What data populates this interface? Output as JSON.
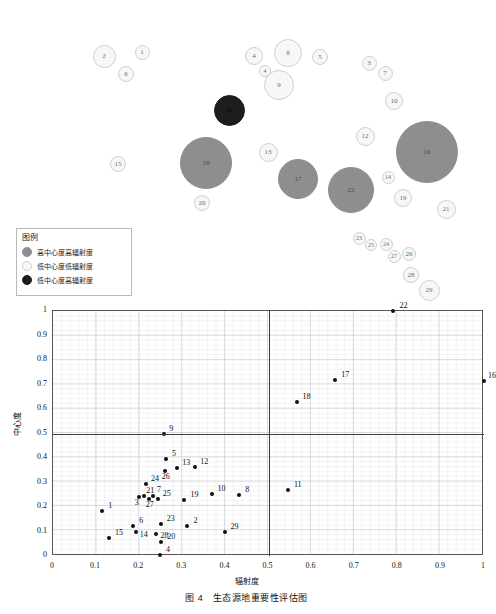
{
  "caption": "图 4　生态源地重要性评估图",
  "legend": {
    "title": "图例",
    "items": [
      {
        "label": "高中心度高辐射度",
        "swatch": "high",
        "color": "#8e8e8e"
      },
      {
        "label": "低中心度低辐射度",
        "swatch": "low",
        "color": "#f7f7f7"
      },
      {
        "label": "低中心度高辐射度",
        "swatch": "dark",
        "color": "#1d1d1d"
      }
    ]
  },
  "bubble_map": {
    "bubbles": [
      {
        "id": "2",
        "label": "2",
        "cx": 104,
        "cy": 56,
        "r": 11.5,
        "cls": "low"
      },
      {
        "id": "1",
        "label": "1",
        "cx": 142,
        "cy": 52,
        "r": 7.5,
        "cls": "low"
      },
      {
        "id": "6",
        "label": "6",
        "cx": 126,
        "cy": 74,
        "r": 8.0,
        "cls": "low"
      },
      {
        "id": "4a",
        "label": "4",
        "cx": 254,
        "cy": 56,
        "r": 9.0,
        "cls": "low"
      },
      {
        "id": "8",
        "label": "8",
        "cx": 288,
        "cy": 53,
        "r": 14.0,
        "cls": "low"
      },
      {
        "id": "5",
        "label": "5",
        "cx": 320,
        "cy": 57,
        "r": 8.0,
        "cls": "low"
      },
      {
        "id": "4b",
        "label": "4",
        "cx": 265,
        "cy": 71,
        "r": 6.0,
        "cls": "low"
      },
      {
        "id": "9",
        "label": "9",
        "cx": 279,
        "cy": 85,
        "r": 15.0,
        "cls": "low"
      },
      {
        "id": "3",
        "label": "3",
        "cx": 369,
        "cy": 63,
        "r": 7.5,
        "cls": "low"
      },
      {
        "id": "7",
        "label": "7",
        "cx": 385,
        "cy": 73,
        "r": 7.5,
        "cls": "low"
      },
      {
        "id": "10",
        "label": "10",
        "cx": 394,
        "cy": 101,
        "r": 9.0,
        "cls": "low"
      },
      {
        "id": "11",
        "label": "11",
        "cx": 229,
        "cy": 110,
        "r": 15.5,
        "cls": "dark"
      },
      {
        "id": "12",
        "label": "12",
        "cx": 365,
        "cy": 136,
        "r": 9.5,
        "cls": "low"
      },
      {
        "id": "16",
        "label": "16",
        "cx": 427,
        "cy": 152,
        "r": 31.0,
        "cls": "high"
      },
      {
        "id": "15",
        "label": "15",
        "cx": 118,
        "cy": 164,
        "r": 8.0,
        "cls": "low"
      },
      {
        "id": "18",
        "label": "18",
        "cx": 206,
        "cy": 163,
        "r": 26.0,
        "cls": "high"
      },
      {
        "id": "13",
        "label": "13",
        "cx": 268,
        "cy": 152,
        "r": 9.5,
        "cls": "low"
      },
      {
        "id": "17",
        "label": "17",
        "cx": 298,
        "cy": 179,
        "r": 20.0,
        "cls": "high"
      },
      {
        "id": "22",
        "label": "22",
        "cx": 351,
        "cy": 190,
        "r": 23.0,
        "cls": "high"
      },
      {
        "id": "14",
        "label": "14",
        "cx": 388,
        "cy": 177,
        "r": 6.5,
        "cls": "low"
      },
      {
        "id": "19",
        "label": "19",
        "cx": 403,
        "cy": 198,
        "r": 9.0,
        "cls": "low"
      },
      {
        "id": "21",
        "label": "21",
        "cx": 446,
        "cy": 209,
        "r": 9.5,
        "cls": "low"
      },
      {
        "id": "20",
        "label": "20",
        "cx": 202,
        "cy": 203,
        "r": 8.0,
        "cls": "low"
      },
      {
        "id": "23",
        "label": "23",
        "cx": 359,
        "cy": 238,
        "r": 6.5,
        "cls": "low"
      },
      {
        "id": "25",
        "label": "25",
        "cx": 371,
        "cy": 245,
        "r": 6.0,
        "cls": "low"
      },
      {
        "id": "24",
        "label": "24",
        "cx": 386,
        "cy": 244,
        "r": 6.5,
        "cls": "low"
      },
      {
        "id": "27",
        "label": "27",
        "cx": 394,
        "cy": 256,
        "r": 6.5,
        "cls": "low"
      },
      {
        "id": "26",
        "label": "26",
        "cx": 409,
        "cy": 254,
        "r": 7.0,
        "cls": "low"
      },
      {
        "id": "28",
        "label": "28",
        "cx": 411,
        "cy": 275,
        "r": 8.0,
        "cls": "low"
      },
      {
        "id": "29",
        "label": "29",
        "cx": 429,
        "cy": 290,
        "r": 10.5,
        "cls": "low"
      }
    ]
  },
  "chart_data": {
    "type": "scatter",
    "title": "",
    "xlabel": "辐射度",
    "ylabel": "中心度",
    "xlim": [
      0,
      1
    ],
    "ylim": [
      0,
      1
    ],
    "xticks": [
      "0",
      "0.1",
      "0.2",
      "0.3",
      "0.4",
      "0.5",
      "0.6",
      "0.7",
      "0.8",
      "0.9",
      "1"
    ],
    "yticks": [
      "0",
      "0.1",
      "0.2",
      "0.3",
      "0.4",
      "0.5",
      "0.6",
      "0.7",
      "0.8",
      "0.9",
      "1"
    ],
    "grid": true,
    "legend_position": "none",
    "reference_lines": {
      "x": 0.5,
      "y": 0.5
    },
    "points": [
      {
        "label": "22",
        "x": 0.79,
        "y": 1.0,
        "lx": 6,
        "ly": -9
      },
      {
        "label": "16",
        "x": 1.0,
        "y": 0.715,
        "lx": 4,
        "ly": -9
      },
      {
        "label": "17",
        "x": 0.655,
        "y": 0.72,
        "lx": 6,
        "ly": -9
      },
      {
        "label": "18",
        "x": 0.565,
        "y": 0.63,
        "lx": 6,
        "ly": -9
      },
      {
        "label": "9",
        "x": 0.258,
        "y": 0.497,
        "lx": 5,
        "ly": -9
      },
      {
        "label": "5",
        "x": 0.262,
        "y": 0.395,
        "lx": 6,
        "ly": -9
      },
      {
        "label": "12",
        "x": 0.33,
        "y": 0.362,
        "lx": 5,
        "ly": -9
      },
      {
        "label": "13",
        "x": 0.288,
        "y": 0.358,
        "lx": 5,
        "ly": -9
      },
      {
        "label": "26",
        "x": 0.259,
        "y": 0.348,
        "lx": -3,
        "ly": 2
      },
      {
        "label": "24",
        "x": 0.216,
        "y": 0.292,
        "lx": 5,
        "ly": -9
      },
      {
        "label": "11",
        "x": 0.545,
        "y": 0.268,
        "lx": 6,
        "ly": -9
      },
      {
        "label": "10",
        "x": 0.368,
        "y": 0.252,
        "lx": 6,
        "ly": -9
      },
      {
        "label": "8",
        "x": 0.432,
        "y": 0.25,
        "lx": 6,
        "ly": -9
      },
      {
        "label": "21",
        "x": 0.212,
        "y": 0.246,
        "lx": 2,
        "ly": -9
      },
      {
        "label": "7",
        "x": 0.232,
        "y": 0.243,
        "lx": 4,
        "ly": -10
      },
      {
        "label": "3",
        "x": 0.199,
        "y": 0.239,
        "lx": -4,
        "ly": 2
      },
      {
        "label": "27",
        "x": 0.222,
        "y": 0.232,
        "lx": -3,
        "ly": 2
      },
      {
        "label": "25",
        "x": 0.243,
        "y": 0.231,
        "lx": 5,
        "ly": -9
      },
      {
        "label": "19",
        "x": 0.305,
        "y": 0.228,
        "lx": 6,
        "ly": -9
      },
      {
        "label": "1",
        "x": 0.114,
        "y": 0.182,
        "lx": 6,
        "ly": -9
      },
      {
        "label": "23",
        "x": 0.25,
        "y": 0.13,
        "lx": 6,
        "ly": -9
      },
      {
        "label": "6",
        "x": 0.186,
        "y": 0.122,
        "lx": 6,
        "ly": -9
      },
      {
        "label": "2",
        "x": 0.312,
        "y": 0.123,
        "lx": 6,
        "ly": -9
      },
      {
        "label": "14",
        "x": 0.192,
        "y": 0.098,
        "lx": 4,
        "ly": -1
      },
      {
        "label": "29",
        "x": 0.398,
        "y": 0.098,
        "lx": 6,
        "ly": -9
      },
      {
        "label": "28",
        "x": 0.238,
        "y": 0.088,
        "lx": 5,
        "ly": -2
      },
      {
        "label": "15",
        "x": 0.13,
        "y": 0.072,
        "lx": 6,
        "ly": -9
      },
      {
        "label": "20",
        "x": 0.251,
        "y": 0.058,
        "lx": 6,
        "ly": -9
      },
      {
        "label": "4",
        "x": 0.248,
        "y": 0.003,
        "lx": 6,
        "ly": -9
      }
    ]
  }
}
